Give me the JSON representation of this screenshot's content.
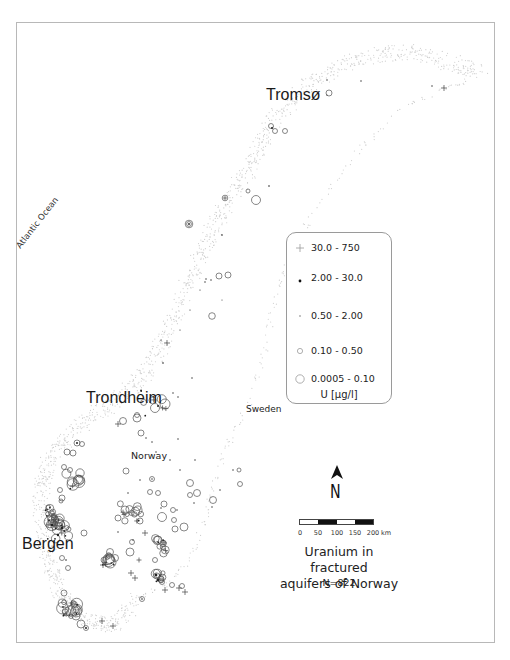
{
  "map": {
    "title_lines": [
      "Uranium in fractured",
      "aquifers of Norway"
    ],
    "sample_count": "N=822",
    "labels": {
      "tromso": "Tromsø",
      "trondheim": "Trondheim",
      "bergen": "Bergen",
      "norway": "Norway",
      "sweden": "Sweden",
      "ocean": "Atlantic Ocean"
    },
    "north_arrow": "N",
    "scale_bar": {
      "ticks": [
        "0",
        "50",
        "100",
        "150",
        "200"
      ],
      "unit": "km"
    },
    "colors": {
      "frame": "#b8b8b8",
      "coast": "#d9d9d9",
      "symbol": "#3a3a3a",
      "legend_border": "#9a9a9a"
    }
  },
  "legend": {
    "unit": "U [µg/l]",
    "classes": [
      {
        "range": "30.0 - 750",
        "symbol": "cross"
      },
      {
        "range": "2.00 - 30.0",
        "symbol": "dot-large"
      },
      {
        "range": "0.50 - 2.00",
        "symbol": "dot-small"
      },
      {
        "range": "0.10 - 0.50",
        "symbol": "circle-small"
      },
      {
        "range": "0.0005 - 0.10",
        "symbol": "circle-large"
      }
    ]
  },
  "chart_data": {
    "type": "scatter",
    "title": "Uranium in fractured aquifers of Norway",
    "subtitle": "N=822",
    "legend_title": "U [µg/l]",
    "classes": [
      "30.0 - 750",
      "2.00 - 30.0",
      "0.50 - 2.00",
      "0.10 - 0.50",
      "0.0005 - 0.10"
    ],
    "annotations": [
      "Tromsø",
      "Trondheim",
      "Bergen",
      "Norway",
      "Sweden",
      "Atlantic Ocean"
    ],
    "scale_km": [
      0,
      50,
      100,
      150,
      200
    ]
  }
}
